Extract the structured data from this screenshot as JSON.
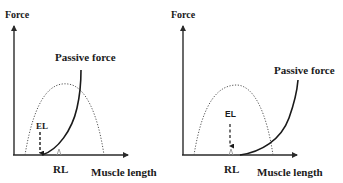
{
  "panels": [
    {
      "id": "left",
      "y_axis_label": "Force",
      "x_axis_label": "Muscle length",
      "passive_label": "Passive force",
      "el_label": "EL",
      "rl_label": "RL",
      "note": "EL to the left of RL (elongated/lengthened state): passive force curve begins at EL"
    },
    {
      "id": "right",
      "y_axis_label": "Force",
      "x_axis_label": "Muscle length",
      "passive_label": "Passive force",
      "el_label": "EL",
      "rl_label": "RL",
      "note": "EL coincides with RL; passive force curve begins to the right of RL"
    }
  ],
  "colors": {
    "axis": "#2a2a2a",
    "curve": "#1a1a1a",
    "dotted": "#555555",
    "tick": "#999999"
  }
}
